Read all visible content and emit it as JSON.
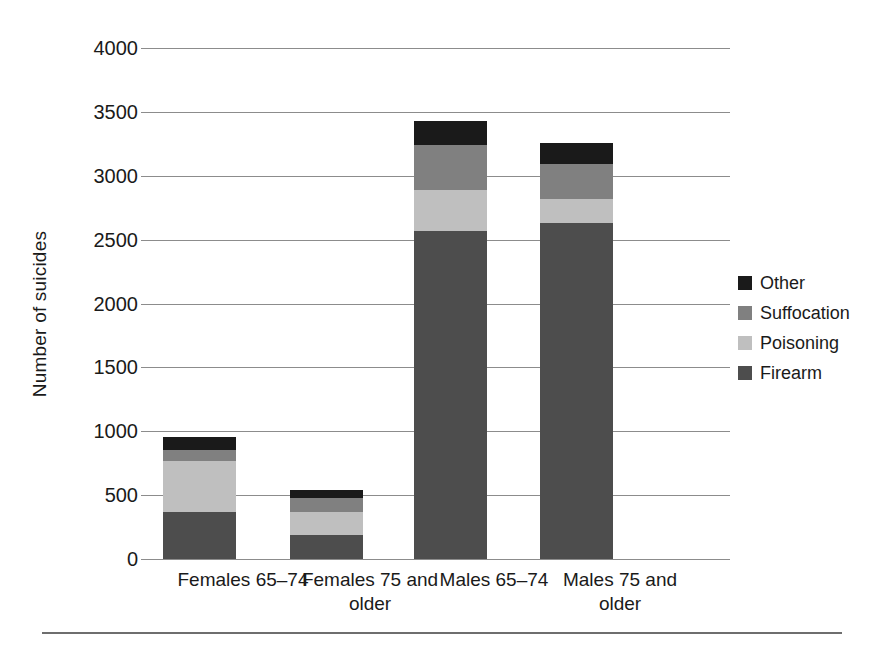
{
  "chart_data": {
    "type": "bar",
    "subtype": "stacked",
    "title": "",
    "xlabel": "",
    "ylabel": "Number of suicides",
    "ylim": [
      0,
      4000
    ],
    "ytick_labels": [
      "4000",
      "3500",
      "3000",
      "2500",
      "2000",
      "1500",
      "1000",
      "500",
      "0"
    ],
    "ytick_values": [
      4000,
      3500,
      3000,
      2500,
      2000,
      1500,
      1000,
      500,
      0
    ],
    "grid": true,
    "grid_axis": "y",
    "legend_position": "right",
    "categories": [
      "Females 65–74",
      "Females 75 and older",
      "Males 65–74",
      "Males 75 and older"
    ],
    "series": [
      {
        "name": "Firearm",
        "color": "#4d4d4d",
        "values": [
          370,
          185,
          2570,
          2630
        ]
      },
      {
        "name": "Poisoning",
        "color": "#bfbfbf",
        "values": [
          400,
          180,
          320,
          190
        ]
      },
      {
        "name": "Suffocation",
        "color": "#808080",
        "values": [
          85,
          110,
          350,
          270
        ]
      },
      {
        "name": "Other",
        "color": "#1a1a1a",
        "values": [
          100,
          65,
          190,
          170
        ]
      }
    ],
    "stack_order_bottom_to_top": [
      "Firearm",
      "Poisoning",
      "Suffocation",
      "Other"
    ],
    "totals": [
      955,
      540,
      3430,
      3260
    ]
  },
  "legend": {
    "items": [
      {
        "label": "Other",
        "color": "#1a1a1a"
      },
      {
        "label": "Suffocation",
        "color": "#808080"
      },
      {
        "label": "Poisoning",
        "color": "#bfbfbf"
      },
      {
        "label": "Firearm",
        "color": "#4d4d4d"
      }
    ]
  },
  "axis": {
    "y_title": "Number of suicides"
  },
  "xticks": [
    {
      "label": "Females 65–74"
    },
    {
      "label": "Females 75 and older"
    },
    {
      "label": "Males 65–74"
    },
    {
      "label": "Males 75 and older"
    }
  ]
}
